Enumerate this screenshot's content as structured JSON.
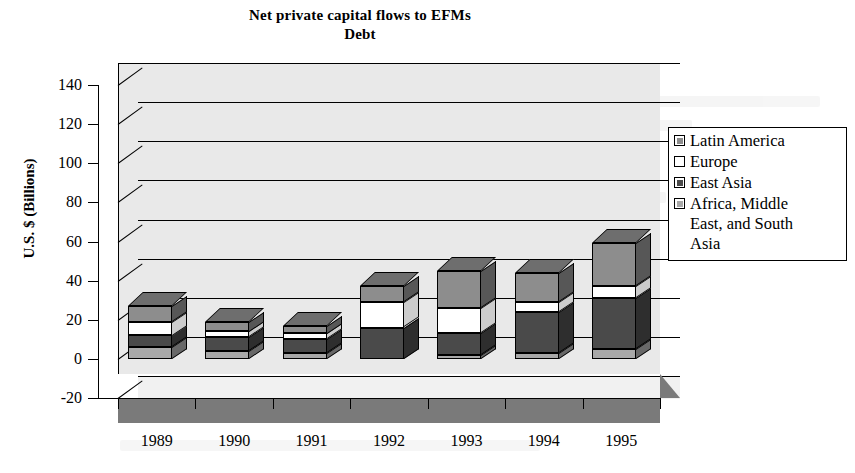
{
  "chart_data": {
    "type": "bar",
    "subtype": "stacked-3d-column",
    "title": "Net private capital flows to EFMs",
    "subtitle": "Debt",
    "xlabel": "",
    "ylabel": "U.S. $ (Billions)",
    "ylim": [
      -20,
      140
    ],
    "ytick_step": 20,
    "yticks": [
      "140",
      "120",
      "100",
      "80",
      "60",
      "40",
      "20",
      "0",
      "-20"
    ],
    "ytick_values": [
      140,
      120,
      100,
      80,
      60,
      40,
      20,
      0,
      -20
    ],
    "grid": true,
    "grid_axis": "y",
    "legend_position": "right",
    "categories": [
      "1989",
      "1990",
      "1991",
      "1992",
      "1993",
      "1994",
      "1995"
    ],
    "series": [
      {
        "name": "Africa, Middle East, and South Asia",
        "color": "#a8a8a8",
        "values": [
          6,
          4,
          3,
          0,
          2,
          3,
          5
        ]
      },
      {
        "name": "East Asia",
        "color": "#4a4a4a",
        "values": [
          6,
          7,
          7,
          16,
          11,
          21,
          26
        ]
      },
      {
        "name": "Europe",
        "color": "#ffffff",
        "values": [
          7,
          3,
          3,
          13,
          13,
          5,
          6
        ]
      },
      {
        "name": "Latin America",
        "color": "#8d8d8d",
        "values": [
          8,
          5,
          4,
          8,
          19,
          15,
          22
        ]
      }
    ],
    "stack_order_bottom_to_top": [
      "Africa, Middle East, and South Asia",
      "East Asia",
      "Europe",
      "Latin America"
    ],
    "totals": [
      27,
      19,
      17,
      37,
      45,
      44,
      59
    ]
  },
  "legend": {
    "items": [
      {
        "label": "Latin America",
        "swatch": "legend-swatch-latin-america",
        "color": "#8d8d8d"
      },
      {
        "label": "Europe",
        "swatch": "legend-swatch-europe",
        "color": "#ffffff"
      },
      {
        "label": "East Asia",
        "swatch": "legend-swatch-east-asia",
        "color": "#4a4a4a"
      },
      {
        "label": "Africa, Middle\nEast, and South\nAsia",
        "swatch": "legend-swatch-africa-middle-east-south-asia",
        "color": "#a8a8a8"
      }
    ]
  },
  "colors": {
    "plot_background": "#e9e9e9",
    "floor": "#7a7a7a",
    "axis": "#000000",
    "page_background": "#ffffff"
  }
}
